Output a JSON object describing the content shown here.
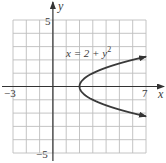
{
  "chart_data": {
    "type": "line",
    "title": "",
    "equation_label": "x = 2 + y",
    "equation_exponent": "2",
    "xlabel": "x",
    "ylabel": "y",
    "xlim": [
      -3,
      7
    ],
    "ylim": [
      -5,
      5
    ],
    "grid": true,
    "grid_step": 1,
    "tick_labels": {
      "x_min": "−3",
      "x_max": "7",
      "y_max": "5",
      "y_min": "−5"
    },
    "series": [
      {
        "name": "x = 2 + y^2",
        "equation": "x = 2 + y^2",
        "points": [
          {
            "x": 7,
            "y": 2.24
          },
          {
            "x": 6,
            "y": 2
          },
          {
            "x": 4.25,
            "y": 1.5
          },
          {
            "x": 3,
            "y": 1
          },
          {
            "x": 2.25,
            "y": 0.5
          },
          {
            "x": 2,
            "y": 0
          },
          {
            "x": 2.25,
            "y": -0.5
          },
          {
            "x": 3,
            "y": -1
          },
          {
            "x": 4.25,
            "y": -1.5
          },
          {
            "x": 6,
            "y": -2
          },
          {
            "x": 7,
            "y": -2.24
          }
        ],
        "arrows_at_ends": true
      }
    ]
  },
  "colors": {
    "grid": "#bdbdbd",
    "axis": "#333333",
    "curve": "#3a3a3a",
    "text": "#3a3a3a"
  }
}
